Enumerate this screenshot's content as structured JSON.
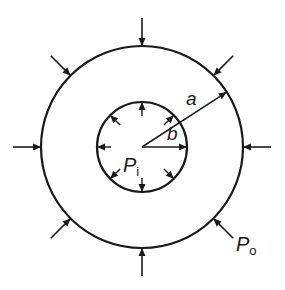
{
  "figure": {
    "type": "thick-walled cylinder under internal and external pressure",
    "center": [
      142,
      147
    ],
    "outer_radius_px": 101,
    "inner_radius_px": 45,
    "stroke_color": "#1a1a1a",
    "background": "#ffffff"
  },
  "labels": {
    "outer_radius": "a",
    "inner_radius": "b",
    "inner_pressure_main": "P",
    "inner_pressure_sub": "i",
    "outer_pressure_main": "P",
    "outer_pressure_sub": "o"
  },
  "arrows": {
    "outer_pressure_angles_deg": [
      -90,
      -45,
      0,
      45,
      90,
      135,
      180,
      225
    ],
    "inner_pressure_angles_deg": [
      -90,
      -45,
      0,
      45,
      90,
      135,
      180,
      225
    ],
    "radius_a_angle_deg": -33,
    "radius_b_angle_deg": 0
  }
}
